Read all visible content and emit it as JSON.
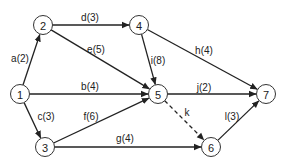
{
  "diagram": {
    "type": "directed-network-graph",
    "nodes": [
      {
        "id": "1",
        "label": "1",
        "x": 20,
        "y": 94
      },
      {
        "id": "2",
        "label": "2",
        "x": 43,
        "y": 25
      },
      {
        "id": "3",
        "label": "3",
        "x": 45,
        "y": 147
      },
      {
        "id": "4",
        "label": "4",
        "x": 139,
        "y": 25
      },
      {
        "id": "5",
        "label": "5",
        "x": 158,
        "y": 94
      },
      {
        "id": "6",
        "label": "6",
        "x": 211,
        "y": 147
      },
      {
        "id": "7",
        "label": "7",
        "x": 266,
        "y": 94
      }
    ],
    "edges": [
      {
        "id": "a",
        "from": "1",
        "to": "2",
        "label": "a(2)",
        "dashed": false,
        "lx": 20,
        "ly": 58
      },
      {
        "id": "b",
        "from": "1",
        "to": "5",
        "label": "b(4)",
        "dashed": false,
        "lx": 90,
        "ly": 86
      },
      {
        "id": "c",
        "from": "1",
        "to": "3",
        "label": "c(3)",
        "dashed": false,
        "lx": 46,
        "ly": 116
      },
      {
        "id": "d",
        "from": "2",
        "to": "4",
        "label": "d(3)",
        "dashed": false,
        "lx": 90,
        "ly": 17
      },
      {
        "id": "e",
        "from": "2",
        "to": "5",
        "label": "e(5)",
        "dashed": false,
        "lx": 96,
        "ly": 49
      },
      {
        "id": "f",
        "from": "3",
        "to": "5",
        "label": "f(6)",
        "dashed": false,
        "lx": 91,
        "ly": 116
      },
      {
        "id": "g",
        "from": "3",
        "to": "6",
        "label": "g(4)",
        "dashed": false,
        "lx": 125,
        "ly": 138
      },
      {
        "id": "h",
        "from": "4",
        "to": "7",
        "label": "h(4)",
        "dashed": false,
        "lx": 204,
        "ly": 50
      },
      {
        "id": "i",
        "from": "4",
        "to": "5",
        "label": "i(8)",
        "dashed": false,
        "lx": 158,
        "ly": 60
      },
      {
        "id": "j",
        "from": "5",
        "to": "7",
        "label": "j(2)",
        "dashed": false,
        "lx": 204,
        "ly": 87
      },
      {
        "id": "k",
        "from": "5",
        "to": "6",
        "label": "k",
        "dashed": true,
        "lx": 187,
        "ly": 112
      },
      {
        "id": "l",
        "from": "6",
        "to": "7",
        "label": "l(3)",
        "dashed": false,
        "lx": 232,
        "ly": 116
      }
    ],
    "style": {
      "node_radius": 9.5,
      "line_color": "#222222",
      "node_stroke": "#333333",
      "background": "#ffffff"
    }
  }
}
